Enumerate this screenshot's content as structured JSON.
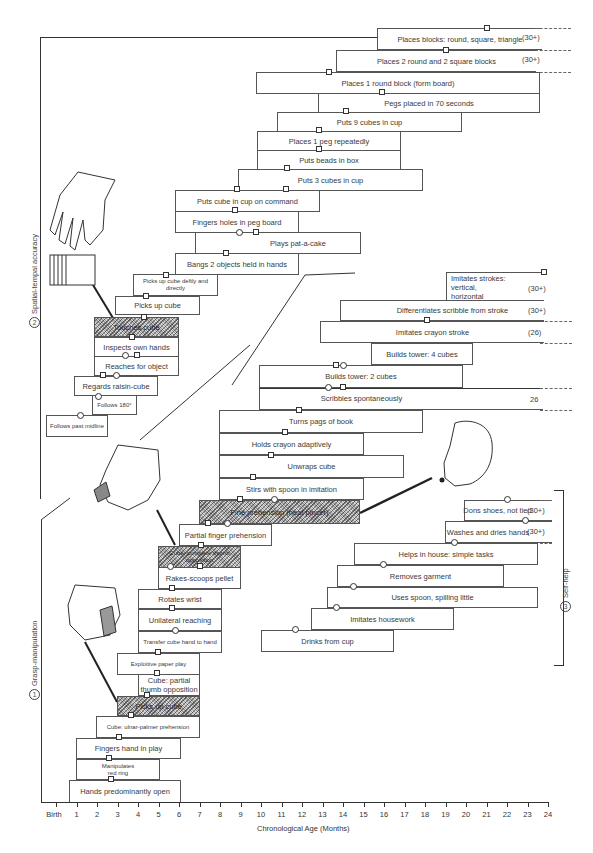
{
  "chart_data": {
    "type": "table",
    "title": "",
    "xlabel": "Chronological Age (Months)",
    "ylabel": "",
    "x_ticks": [
      "Birth",
      "1",
      "2",
      "3",
      "4",
      "5",
      "6",
      "7",
      "8",
      "9",
      "10",
      "11",
      "12",
      "13",
      "14",
      "15",
      "16",
      "17",
      "18",
      "19",
      "20",
      "21",
      "22",
      "23",
      "24"
    ],
    "x_range_months": [
      0,
      24
    ],
    "marker_legend": {
      "square": "one normative source",
      "circle": "another normative source"
    },
    "sections": [
      {
        "id": 1,
        "name": "Grasp-manipulation",
        "items": [
          {
            "label": "Hands predominantly open",
            "start": 2.0,
            "end": 6.0,
            "markers": [
              {
                "type": "square",
                "age": 2.7
              }
            ]
          },
          {
            "label": "Manipulates red ring",
            "start": 2.5,
            "end": 5.0,
            "markers": [
              {
                "type": "square",
                "age": 2.5
              }
            ]
          },
          {
            "label": "Fingers hand in play",
            "start": 2.0,
            "end": 5.0,
            "markers": [
              {
                "type": "square",
                "age": 3.0
              }
            ]
          },
          {
            "label": "Cube: ulnar-palmer prehension",
            "start": 1.0,
            "end": 7.0,
            "markers": [
              {
                "type": "square",
                "age": 3.7
              }
            ]
          },
          {
            "label": "Picks up cube",
            "start": 3.0,
            "end": 6.0,
            "shaded": true,
            "markers": [
              {
                "type": "square",
                "age": 4.5
              }
            ]
          },
          {
            "label": "Cube: partial thumb opposition",
            "start": 4.0,
            "end": 7.0,
            "markers": [
              {
                "type": "square",
                "age": 5.0
              }
            ]
          },
          {
            "label": "Exploitive paper play",
            "start": 4.0,
            "end": 7.0,
            "markers": [
              {
                "type": "square",
                "age": 5.0
              }
            ]
          },
          {
            "label": "Transfer cube hand to hand",
            "start": 5.0,
            "end": 8.0,
            "markers": [
              {
                "type": "circle",
                "age": 6.0
              }
            ]
          },
          {
            "label": "Unilateral reaching",
            "start": 5.0,
            "end": 8.0,
            "markers": [
              {
                "type": "square",
                "age": 5.8
              }
            ]
          },
          {
            "label": "Rotates wrist",
            "start": 5.0,
            "end": 8.0,
            "markers": [
              {
                "type": "square",
                "age": 5.5
              }
            ]
          },
          {
            "label": "Rakes-scoops pellet",
            "start": 6.0,
            "end": 8.2,
            "markers": [
              {
                "type": "circle",
                "age": 6.5
              },
              {
                "type": "square",
                "age": 7.0
              }
            ]
          },
          {
            "label": "Cube: complete thumb opposition",
            "start": 6.0,
            "end": 8.2,
            "shaded": true,
            "markers": [
              {
                "type": "square",
                "age": 7.0
              }
            ]
          },
          {
            "label": "Partial finger prehension",
            "start": 7.0,
            "end": 9.5,
            "markers": [
              {
                "type": "square",
                "age": 7.8
              },
              {
                "type": "circle",
                "age": 8.8
              }
            ]
          },
          {
            "label": "Fine prehension (neat pincer)",
            "start": 8.5,
            "end": 14.5,
            "shaded": true,
            "markers": [
              {
                "type": "square",
                "age": 10.0
              },
              {
                "type": "circle",
                "age": 11.0
              }
            ]
          },
          {
            "label": "Stirs with spoon in imitation",
            "start": 10.0,
            "end": 15.0,
            "markers": [
              {
                "type": "square",
                "age": 10.5
              }
            ]
          },
          {
            "label": "Unwraps cube",
            "start": 10.0,
            "end": 17.0,
            "markers": [
              {
                "type": "square",
                "age": 11.0
              }
            ]
          },
          {
            "label": "Holds crayon adaptively",
            "start": 10.0,
            "end": 15.0,
            "markers": [
              {
                "type": "square",
                "age": 12.0
              }
            ]
          },
          {
            "label": "Turns pages of book",
            "start": 10.0,
            "end": 19.0,
            "markers": [
              {
                "type": "square",
                "age": 13.0
              }
            ]
          },
          {
            "label": "Scribbles spontaneously",
            "start": 13.0,
            "end": 24.0,
            "note": "26",
            "open_end": true,
            "markers": [
              {
                "type": "circle",
                "age": 13.5
              },
              {
                "type": "square",
                "age": 14.0
              }
            ]
          },
          {
            "label": "Builds tower: 2 cubes",
            "start": 13.0,
            "end": 20.0,
            "markers": [
              {
                "type": "square",
                "age": 13.7
              },
              {
                "type": "circle",
                "age": 14.0
              }
            ]
          },
          {
            "label": "Builds tower: 4 cubes",
            "start": 15.0,
            "end": 20.0,
            "markers": []
          },
          {
            "label": "Imitates crayon stroke",
            "start": 14.0,
            "end": 24.0,
            "note": "(26)",
            "open_end": true,
            "markers": [
              {
                "type": "square",
                "age": 18.0
              }
            ]
          },
          {
            "label": "Differentiates scribble from stroke",
            "start": 15.0,
            "end": 24.0,
            "note": "(30+)",
            "open_end": true,
            "markers": []
          },
          {
            "label": "Imitates strokes: vertical, horizontal",
            "start": 20.0,
            "end": 24.0,
            "note": "(30+)",
            "open_end": true,
            "markers": [
              {
                "type": "square",
                "age": 24.0
              }
            ]
          }
        ]
      },
      {
        "id": 2,
        "name": "Spatial-tempal accuracy",
        "items": [
          {
            "label": "Follows past midline",
            "start": 0.5,
            "end": 3.0,
            "markers": [
              {
                "type": "circle",
                "age": 2.0
              }
            ]
          },
          {
            "label": "Follows 180°",
            "start": 2.5,
            "end": 4.5,
            "markers": [
              {
                "type": "circle",
                "age": 3.0
              }
            ]
          },
          {
            "label": "Regards raisin-cube",
            "start": 1.5,
            "end": 4.5,
            "markers": [
              {
                "type": "square",
                "age": 2.3
              },
              {
                "type": "circle",
                "age": 2.8
              }
            ]
          },
          {
            "label": "Reaches for object",
            "start": 4.0,
            "end": 6.5,
            "markers": [
              {
                "type": "circle",
                "age": 4.7
              },
              {
                "type": "square",
                "age": 5.0
              }
            ]
          },
          {
            "label": "Inspects own hands",
            "start": 4.0,
            "end": 6.5,
            "markers": [
              {
                "type": "square",
                "age": 5.0
              }
            ]
          },
          {
            "label": "Touches cube",
            "start": 4.0,
            "end": 6.5,
            "shaded": true,
            "markers": [
              {
                "type": "square",
                "age": 5.4
              }
            ]
          },
          {
            "label": "Picks up cube",
            "start": 5.0,
            "end": 7.5,
            "markers": [
              {
                "type": "square",
                "age": 5.7
              }
            ]
          },
          {
            "label": "Picks up cube deftly and directly",
            "start": 5.5,
            "end": 8.0,
            "markers": [
              {
                "type": "square",
                "age": 6.5
              }
            ]
          },
          {
            "label": "Bangs 2 objects held in hands",
            "start": 7.0,
            "end": 10.0,
            "markers": [
              {
                "type": "square",
                "age": 8.0
              }
            ]
          },
          {
            "label": "Plays pat-a-cake",
            "start": 8.0,
            "end": 13.0,
            "markers": [
              {
                "type": "circle",
                "age": 8.5
              },
              {
                "type": "square",
                "age": 9.0
              }
            ]
          },
          {
            "label": "Fingers holes in peg board",
            "start": 7.0,
            "end": 11.5,
            "markers": [
              {
                "type": "square",
                "age": 8.8
              }
            ]
          },
          {
            "label": "Puts cube in cup on command",
            "start": 7.0,
            "end": 12.5,
            "markers": [
              {
                "type": "square",
                "age": 9.0
              }
            ]
          },
          {
            "label": "Puts 3 cubes in cup",
            "start": 10.0,
            "end": 16.0,
            "markers": [
              {
                "type": "square",
                "age": 11.0
              }
            ]
          },
          {
            "label": "Puts beads in box",
            "start": 10.0,
            "end": 17.0,
            "markers": [
              {
                "type": "square",
                "age": 11.0
              }
            ]
          },
          {
            "label": "Places 1 peg repeatedly",
            "start": 10.0,
            "end": 17.0,
            "markers": [
              {
                "type": "square",
                "age": 12.0
              }
            ]
          },
          {
            "label": "Puts 9 cubes in cup",
            "start": 11.0,
            "end": 20.0,
            "markers": [
              {
                "type": "square",
                "age": 13.0
              }
            ]
          },
          {
            "label": "Pegs placed in 70 seconds",
            "start": 13.0,
            "end": 24.0,
            "markers": [
              {
                "type": "square",
                "age": 16.0
              }
            ]
          },
          {
            "label": "Places 1 round block (form board)",
            "start": 10.0,
            "end": 24.0,
            "markers": [
              {
                "type": "square",
                "age": 13.0
              }
            ]
          },
          {
            "label": "Places 2 round and 2 square blocks",
            "start": 13.0,
            "end": 24.0,
            "note": "(30+)",
            "open_end": true,
            "markers": [
              {
                "type": "square",
                "age": 19.0
              }
            ]
          },
          {
            "label": "Places blocks: round, square, triangle",
            "start": 15.0,
            "end": 24.0,
            "note": "(30+)",
            "open_end": true,
            "markers": [
              {
                "type": "square",
                "age": 21.0
              }
            ]
          }
        ]
      },
      {
        "id": 3,
        "name": "Self-help",
        "items": [
          {
            "label": "Drinks from cup",
            "start": 10.0,
            "end": 18.0,
            "markers": [
              {
                "type": "circle",
                "age": 11.7
              }
            ]
          },
          {
            "label": "Imitates housework",
            "start": 12.5,
            "end": 20.0,
            "markers": [
              {
                "type": "circle",
                "age": 13.5
              }
            ]
          },
          {
            "label": "Uses spoon, spilling little",
            "start": 13.0,
            "end": 23.0,
            "markers": [
              {
                "type": "circle",
                "age": 14.5
              }
            ]
          },
          {
            "label": "Removes garment",
            "start": 14.0,
            "end": 22.0,
            "markers": [
              {
                "type": "circle",
                "age": 16.0
              }
            ]
          },
          {
            "label": "Helps in house: simple tasks",
            "start": 15.0,
            "end": 23.0,
            "markers": [
              {
                "type": "circle",
                "age": 18.0
              }
            ]
          },
          {
            "label": "Washes and dries hands",
            "start": 20.0,
            "end": 24.0,
            "note": "(30+)",
            "open_end": true,
            "markers": [
              {
                "type": "circle",
                "age": 22.5
              }
            ]
          },
          {
            "label": "Dons shoes, not tied",
            "start": 21.0,
            "end": 24.0,
            "note": "(30+)",
            "open_end": true,
            "markers": [
              {
                "type": "circle",
                "age": 22.0
              }
            ]
          }
        ]
      }
    ]
  },
  "axis": {
    "label": "Chronological Age (Months)",
    "ticks": [
      "Birth",
      "1",
      "2",
      "3",
      "4",
      "5",
      "6",
      "7",
      "8",
      "9",
      "10",
      "11",
      "12",
      "13",
      "14",
      "15",
      "16",
      "17",
      "18",
      "19",
      "20",
      "21",
      "22",
      "23",
      "24"
    ]
  },
  "sections": {
    "s1": {
      "num": "1",
      "name": "Grasp-manipulation"
    },
    "s2": {
      "num": "2",
      "name": "Spatial-tempal accuracy"
    },
    "s3": {
      "num": "3",
      "name": "Self-help"
    }
  },
  "boxes": {
    "b_places_blocks": {
      "label": "Places blocks:  round, square, triangle",
      "note": "(30+)"
    },
    "b_places_2round": {
      "label": "Places 2 round and 2 square blocks",
      "note": "(30+)"
    },
    "b_places_1round": {
      "label": "Places 1 round block (form board)"
    },
    "b_pegs70": {
      "label": "Pegs placed in 70 seconds"
    },
    "b_puts9": {
      "label": "Puts 9 cubes in cup"
    },
    "b_places1peg": {
      "label": "Places 1 peg repeatedly"
    },
    "b_beads": {
      "label": "Puts beads in box"
    },
    "b_puts3": {
      "label": "Puts 3 cubes in cup"
    },
    "b_cube_cmd": {
      "label": "Puts cube in cup on command"
    },
    "b_fingers_holes": {
      "label": "Fingers holes in peg board"
    },
    "b_patacake": {
      "label": "Plays pat-a-cake"
    },
    "b_bangs": {
      "label": "Bangs 2 objects held in hands"
    },
    "b_pickdeft": {
      "label": "Picks up cube deftly and directly"
    },
    "b_pickup_a": {
      "label": "Picks up cube"
    },
    "b_touches": {
      "label": "Touches cube"
    },
    "b_inspects": {
      "label": "Inspects own hands"
    },
    "b_reaches": {
      "label": "Reaches for object"
    },
    "b_regards": {
      "label": "Regards raisin-cube"
    },
    "b_follows180": {
      "label": "Follows 180°"
    },
    "b_follows_mid": {
      "label": "Follows past midline"
    },
    "b_imit_strokes": {
      "label": "Imitates strokes: vertical, horizontal",
      "note": "(30+)"
    },
    "b_diff_scribble": {
      "label": "Differentiates scribble from stroke",
      "note": "(30+)"
    },
    "b_imit_crayon": {
      "label": "Imitates crayon stroke",
      "note": "(26)"
    },
    "b_tower4": {
      "label": "Builds tower:  4 cubes"
    },
    "b_tower2": {
      "label": "Builds tower:  2 cubes"
    },
    "b_scribbles": {
      "label": "Scribbles spontaneously",
      "note": "26"
    },
    "b_turns_pages": {
      "label": "Turns pags of book"
    },
    "b_holds_crayon": {
      "label": "Holds crayon adaptively"
    },
    "b_unwraps": {
      "label": "Unwraps cube"
    },
    "b_stirs": {
      "label": "Stirs with spoon in imitation"
    },
    "b_fine_preh": {
      "label": "Fine prehension (neat pincer)"
    },
    "b_partial_finger": {
      "label": "Partial finger prehension"
    },
    "b_cube_complete": {
      "label": "Cube: complete thumb opposition"
    },
    "b_rakes": {
      "label": "Rakes-scoops pellet"
    },
    "b_rotates": {
      "label": "Rotates wrist"
    },
    "b_unilateral": {
      "label": "Unilateral reaching"
    },
    "b_transfer": {
      "label": "Transfer cube hand to hand"
    },
    "b_exploitive": {
      "label": "Exploitive paper play"
    },
    "b_partial_thumb": {
      "label": "Cube:  partial  thumb opposition"
    },
    "b_pickup_b": {
      "label": "Picks up cube"
    },
    "b_ulnar": {
      "label": "Cube: ulnar-palmer prehension"
    },
    "b_fingers_hand": {
      "label": "Fingers hand in play"
    },
    "b_manip_ring": {
      "label": "Manipulates red ring"
    },
    "b_hands_open": {
      "label": "Hands predominantly open"
    },
    "b_dons": {
      "label": "Dons shoes, not tied",
      "note": "(30+)"
    },
    "b_washes": {
      "label": "Washes and dries hands",
      "note": "(30+)"
    },
    "b_helps": {
      "label": "Helps in house:  simple tasks"
    },
    "b_removes": {
      "label": "Removes garment"
    },
    "b_spoon": {
      "label": "Uses spoon, spilling little"
    },
    "b_housework": {
      "label": "Imitates housework"
    },
    "b_drinks": {
      "label": "Drinks from cup"
    }
  }
}
